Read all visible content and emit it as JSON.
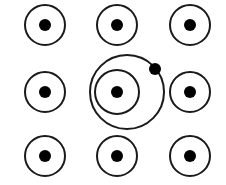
{
  "diagram": {
    "stroke_color": "#1a1a1a",
    "fill_color": "#000000",
    "background": "#ffffff",
    "grid": [
      {
        "id": "r1c1",
        "cx": 45,
        "cy": 25,
        "r": 20,
        "dot_r": 6
      },
      {
        "id": "r1c2",
        "cx": 117,
        "cy": 25,
        "r": 20,
        "dot_r": 6
      },
      {
        "id": "r1c3",
        "cx": 190,
        "cy": 25,
        "r": 20,
        "dot_r": 6
      },
      {
        "id": "r2c1",
        "cx": 45,
        "cy": 92,
        "r": 20,
        "dot_r": 6
      },
      {
        "id": "r2c2",
        "cx": 117,
        "cy": 92,
        "r": 22,
        "dot_r": 6
      },
      {
        "id": "r2c3",
        "cx": 190,
        "cy": 92,
        "r": 20,
        "dot_r": 6
      },
      {
        "id": "r3c1",
        "cx": 45,
        "cy": 156,
        "r": 20,
        "dot_r": 6
      },
      {
        "id": "r3c2",
        "cx": 117,
        "cy": 156,
        "r": 20,
        "dot_r": 6
      },
      {
        "id": "r3c3",
        "cx": 190,
        "cy": 156,
        "r": 20,
        "dot_r": 6
      }
    ],
    "orbit": {
      "cx": 127,
      "cy": 92,
      "r": 37
    },
    "satellite": {
      "cx": 155,
      "cy": 69,
      "r": 6
    }
  }
}
